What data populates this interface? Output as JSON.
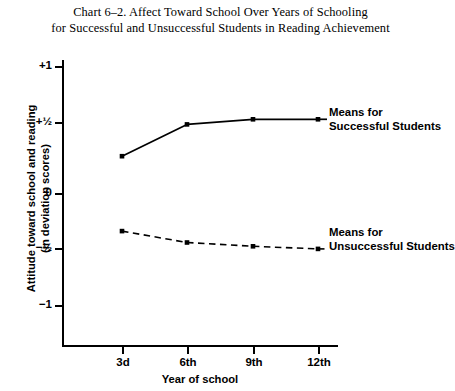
{
  "chart_data": {
    "type": "line",
    "title": "Chart 6–2. Affect Toward School Over Years of Schooling for Successful and Unsuccessful Students in Reading Achievement",
    "title_lines": [
      "Chart 6–2. Affect Toward School Over Years of Schooling",
      "for Successful and Unsuccessful Students in Reading Achievement"
    ],
    "xlabel": "Year of school",
    "ylabel": "Attitude toward school and reading (in deviation scores)",
    "ylabel_lines": [
      "Attitude toward school and reading",
      "(in deviation scores)"
    ],
    "categories": [
      "3d",
      "6th",
      "9th",
      "12th"
    ],
    "x_tick_labels": [
      "3d",
      "6th",
      "9th",
      "12th"
    ],
    "y_tick_labels": [
      "+1",
      "+½",
      "0",
      "−½",
      "−1"
    ],
    "y_tick_values": [
      1,
      0.5,
      0,
      -0.5,
      -1
    ],
    "ylim": [
      -1.15,
      1.15
    ],
    "grid": false,
    "legend_position": "inline-annotations",
    "series": [
      {
        "name": "Means for Successful Students",
        "name_lines": [
          "Means for",
          "Successful Students"
        ],
        "style": "solid",
        "color": "#000000",
        "values": [
          0.29,
          0.54,
          0.58,
          0.58
        ]
      },
      {
        "name": "Means for Unsuccessful Students",
        "name_lines": [
          "Means for",
          "Unsuccessful Students"
        ],
        "style": "dashed",
        "color": "#000000",
        "values": [
          -0.3,
          -0.39,
          -0.42,
          -0.44
        ]
      }
    ],
    "annotations": [
      {
        "id": "successful",
        "text": "Means for Successful Students"
      },
      {
        "id": "unsuccessful",
        "text": "Means for Unsuccessful Students"
      }
    ]
  },
  "colors": {
    "background": "#ffffff",
    "ink": "#000000",
    "axis": "#000000"
  }
}
